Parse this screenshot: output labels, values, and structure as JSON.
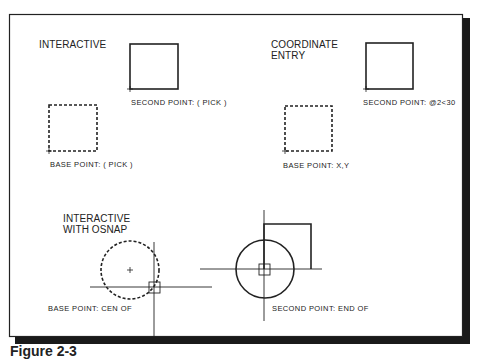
{
  "figure": {
    "caption": "Figure 2-3",
    "panels": [
      {
        "title": "INTERACTIVE",
        "second_point_prompt": "SECOND POINT: ( PICK )",
        "base_point_prompt": "BASE POINT: ( PICK )"
      },
      {
        "title_line1": "COORDINATE",
        "title_line2": "ENTRY",
        "second_point_prompt": "SECOND POINT: @2<30",
        "base_point_prompt": "BASE POINT: X,Y"
      },
      {
        "title_line1": "INTERACTIVE",
        "title_line2": "WITH OSNAP",
        "base_point_prompt": "BASE POINT: CEN OF",
        "second_point_prompt": "SECOND POINT: END OF"
      }
    ],
    "colors": {
      "ink": "#222222",
      "background": "#ffffff",
      "shadow": "#1a1a1a"
    }
  }
}
